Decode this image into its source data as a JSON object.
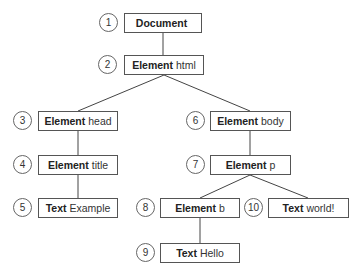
{
  "diagram": {
    "nodes": [
      {
        "id": 1,
        "num": "1",
        "kind": "Document",
        "value": "",
        "x": 124,
        "y": 13,
        "w": 78,
        "cx": 108,
        "cy": 23
      },
      {
        "id": 2,
        "num": "2",
        "kind": "Element",
        "value": "html",
        "x": 124,
        "y": 55,
        "w": 80,
        "cx": 107,
        "cy": 65
      },
      {
        "id": 3,
        "num": "3",
        "kind": "Element",
        "value": "head",
        "x": 38,
        "y": 111,
        "w": 80,
        "cx": 22,
        "cy": 121
      },
      {
        "id": 4,
        "num": "4",
        "kind": "Element",
        "value": "title",
        "x": 38,
        "y": 155,
        "w": 80,
        "cx": 22,
        "cy": 165
      },
      {
        "id": 5,
        "num": "5",
        "kind": "Text",
        "value": "Example",
        "x": 38,
        "y": 198,
        "w": 80,
        "cx": 22,
        "cy": 208
      },
      {
        "id": 6,
        "num": "6",
        "kind": "Element",
        "value": "body",
        "x": 210,
        "y": 111,
        "w": 81,
        "cx": 195,
        "cy": 121
      },
      {
        "id": 7,
        "num": "7",
        "kind": "Element",
        "value": "p",
        "x": 210,
        "y": 155,
        "w": 81,
        "cx": 195,
        "cy": 165
      },
      {
        "id": 8,
        "num": "8",
        "kind": "Element",
        "value": "b",
        "x": 160,
        "y": 198,
        "w": 80,
        "cx": 145,
        "cy": 208
      },
      {
        "id": 9,
        "num": "9",
        "kind": "Text",
        "value": "Hello",
        "x": 160,
        "y": 243,
        "w": 80,
        "cx": 145,
        "cy": 253
      },
      {
        "id": 10,
        "num": "10",
        "kind": "Text",
        "value": "world!",
        "x": 268,
        "y": 198,
        "w": 81,
        "cx": 253,
        "cy": 208
      }
    ],
    "edges": [
      {
        "from": 1,
        "to": 2
      },
      {
        "from": 2,
        "to": 3
      },
      {
        "from": 2,
        "to": 6
      },
      {
        "from": 3,
        "to": 4
      },
      {
        "from": 4,
        "to": 5
      },
      {
        "from": 6,
        "to": 7
      },
      {
        "from": 7,
        "to": 8
      },
      {
        "from": 7,
        "to": 10
      },
      {
        "from": 8,
        "to": 9
      }
    ],
    "colors": {
      "line": "#444444",
      "border": "#555555",
      "text": "#222222"
    }
  }
}
